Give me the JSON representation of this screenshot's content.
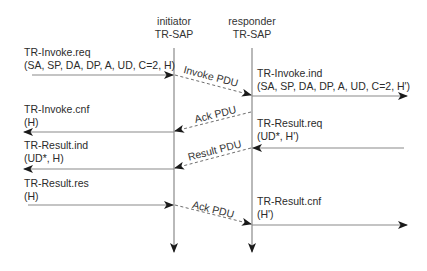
{
  "lifelines": {
    "initiator": {
      "line1": "initiator",
      "line2": "TR-SAP"
    },
    "responder": {
      "line1": "responder",
      "line2": "TR-SAP"
    }
  },
  "primitives": {
    "invoke_req": {
      "name": "TR-Invoke.req",
      "params": "(SA, SP, DA, DP, A, UD, C=2, H)"
    },
    "invoke_ind": {
      "name": "TR-Invoke.ind",
      "params": "(SA, SP, DA, DP, A, UD, C=2, H')"
    },
    "invoke_cnf": {
      "name": "TR-Invoke.cnf",
      "params": "(H)"
    },
    "result_req": {
      "name": "TR-Result.req",
      "params": "(UD*, H')"
    },
    "result_ind": {
      "name": "TR-Result.ind",
      "params": "(UD*, H)"
    },
    "result_res": {
      "name": "TR-Result.res",
      "params": "(H)"
    },
    "result_cnf": {
      "name": "TR-Result.cnf",
      "params": "(H')"
    }
  },
  "pdus": {
    "invoke": "Invoke PDU",
    "ack1": "Ack PDU",
    "result": "Result PDU",
    "ack2": "Ack PDU"
  },
  "colors": {
    "line": "#8a8a8a",
    "arrowhead": "#1a1a1a",
    "text": "#2b2b2b"
  }
}
